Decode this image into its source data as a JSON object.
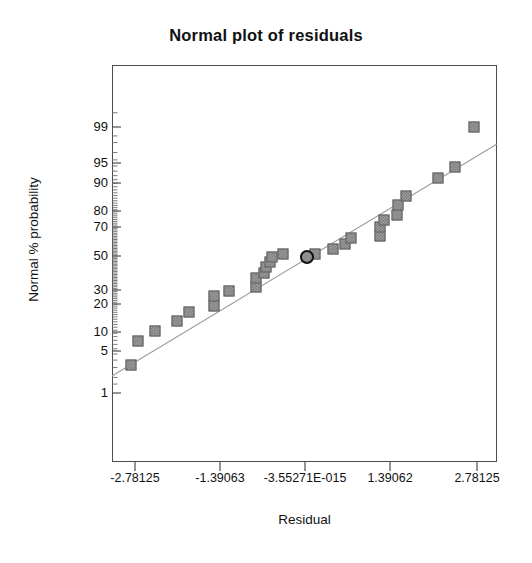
{
  "chart_data": {
    "type": "scatter",
    "title": "Normal plot of residuals",
    "xlabel": "Residual",
    "ylabel": "Normal % probability",
    "grid": false,
    "legend": null,
    "x_tick_labels": [
      "-2.78125",
      "-1.39063",
      "-3.55271E-015",
      "1.39062",
      "2.78125"
    ],
    "x_tick_values": [
      -2.78125,
      -1.39063,
      -3.55271e-15,
      1.39062,
      2.78125
    ],
    "x_tick_px": [
      135,
      220,
      305,
      390,
      477
    ],
    "xlim": [
      -3.35,
      3.35
    ],
    "y_tick_labels": [
      "99",
      "95",
      "90",
      "80",
      "70",
      "50",
      "30",
      "20",
      "10",
      "5",
      "1"
    ],
    "y_tick_values": [
      99,
      95,
      90,
      80,
      70,
      50,
      30,
      20,
      10,
      5,
      1
    ],
    "y_tick_px": [
      127,
      163,
      183,
      211,
      227,
      256,
      290,
      304,
      332,
      351,
      393
    ],
    "reference_line": {
      "label": "normal reference line",
      "x1_px": 112,
      "y1_px": 376,
      "x2_px": 497,
      "y2_px": 144
    },
    "points": [
      {
        "x_px": 131,
        "y_px": 365,
        "marker": "square"
      },
      {
        "x_px": 138,
        "y_px": 341,
        "marker": "square"
      },
      {
        "x_px": 155,
        "y_px": 331,
        "marker": "square"
      },
      {
        "x_px": 177,
        "y_px": 321,
        "marker": "square"
      },
      {
        "x_px": 189,
        "y_px": 312,
        "marker": "square"
      },
      {
        "x_px": 214,
        "y_px": 306,
        "marker": "square"
      },
      {
        "x_px": 214,
        "y_px": 296,
        "marker": "square"
      },
      {
        "x_px": 229,
        "y_px": 291,
        "marker": "square"
      },
      {
        "x_px": 256,
        "y_px": 287,
        "marker": "square"
      },
      {
        "x_px": 256,
        "y_px": 278,
        "marker": "square"
      },
      {
        "x_px": 264,
        "y_px": 273,
        "marker": "square"
      },
      {
        "x_px": 266,
        "y_px": 267,
        "marker": "square"
      },
      {
        "x_px": 270,
        "y_px": 262,
        "marker": "square"
      },
      {
        "x_px": 272,
        "y_px": 257,
        "marker": "square"
      },
      {
        "x_px": 283,
        "y_px": 254,
        "marker": "square"
      },
      {
        "x_px": 315,
        "y_px": 254,
        "marker": "square"
      },
      {
        "x_px": 333,
        "y_px": 249,
        "marker": "square"
      },
      {
        "x_px": 345,
        "y_px": 244,
        "marker": "square"
      },
      {
        "x_px": 351,
        "y_px": 238,
        "marker": "square"
      },
      {
        "x_px": 380,
        "y_px": 236,
        "marker": "square"
      },
      {
        "x_px": 380,
        "y_px": 227,
        "marker": "square"
      },
      {
        "x_px": 384,
        "y_px": 220,
        "marker": "square"
      },
      {
        "x_px": 397,
        "y_px": 215,
        "marker": "square"
      },
      {
        "x_px": 398,
        "y_px": 205,
        "marker": "square"
      },
      {
        "x_px": 406,
        "y_px": 196,
        "marker": "square"
      },
      {
        "x_px": 438,
        "y_px": 178,
        "marker": "square"
      },
      {
        "x_px": 455,
        "y_px": 167,
        "marker": "square"
      },
      {
        "x_px": 474,
        "y_px": 127,
        "marker": "square"
      },
      {
        "x_px": 307,
        "y_px": 257,
        "marker": "circle",
        "highlighted": true
      }
    ],
    "colors": {
      "marker_fill": "#9a9a9a",
      "marker_edge": "#595959",
      "highlight_edge": "#111111",
      "highlight_fill": "#8e8e8e",
      "line": "#9b9b9b",
      "frame": "#4d4d4d",
      "text": "#111111",
      "background": "#ffffff"
    }
  }
}
